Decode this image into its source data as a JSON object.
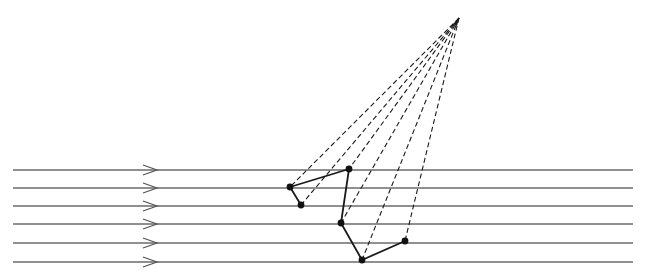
{
  "diagram": {
    "title": "",
    "colors": {
      "background": "#ffffff",
      "ray_line": "#6b6b6b",
      "arrow": "#555555",
      "projection_line": "#1a1a1a",
      "polygon_edge": "#1a1a1a",
      "vertex": "#111111"
    },
    "parallel_rays": {
      "x_start": 13,
      "x_end": 633,
      "arrow_x": 150,
      "y_positions": [
        170,
        188,
        206,
        224,
        243,
        262
      ]
    },
    "apex": {
      "x": 459,
      "y": 18
    },
    "vertices": [
      {
        "id": "v1",
        "x": 290,
        "y": 187
      },
      {
        "id": "v2",
        "x": 349,
        "y": 169
      },
      {
        "id": "v3",
        "x": 301,
        "y": 205
      },
      {
        "id": "v4",
        "x": 341,
        "y": 223
      },
      {
        "id": "v5",
        "x": 362,
        "y": 260
      },
      {
        "id": "v6",
        "x": 405,
        "y": 241
      }
    ],
    "polygon_path": [
      "v3",
      "v1",
      "v2",
      "v4",
      "v5",
      "v6"
    ]
  }
}
